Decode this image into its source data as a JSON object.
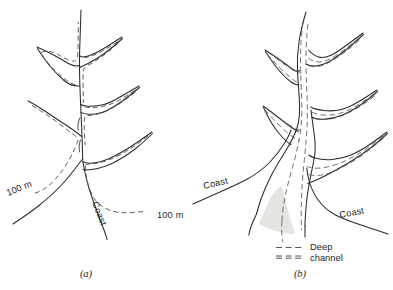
{
  "figure": {
    "background_color": "#ffffff",
    "ink_color": "#2b2b2b",
    "dashed_color": "#555555",
    "sediment_color": "#e6e4e1",
    "panels": [
      {
        "id": "a",
        "caption": "(a)",
        "description": "Dendritic drowned river valley (ria) with 100 m depth contour",
        "labels": [
          {
            "name": "contour-label-left",
            "text": "100 m",
            "x": 8,
            "y": 196,
            "rotation": -22
          },
          {
            "name": "contour-label-right",
            "text": "100 m",
            "x": 157,
            "y": 218,
            "rotation": 0
          },
          {
            "name": "coast-label",
            "text": "Coast",
            "x": 92,
            "y": 203,
            "rotation": 68
          }
        ]
      },
      {
        "id": "b",
        "caption": "(b)",
        "description": "Funnel-shaped estuary with deep channels and sediment banks",
        "labels": [
          {
            "name": "coast-label-left",
            "text": "Coast",
            "x": 204,
            "y": 189,
            "rotation": -13
          },
          {
            "name": "coast-label-right",
            "text": "Coast",
            "x": 340,
            "y": 218,
            "rotation": -11
          }
        ],
        "legend": {
          "title_line_1": "Deep",
          "title_line_2": "channel",
          "entries": [
            {
              "name": "legend-single-dash",
              "style": "dashed-single"
            },
            {
              "name": "legend-double-dash",
              "style": "dashed-pair"
            }
          ]
        }
      }
    ]
  }
}
